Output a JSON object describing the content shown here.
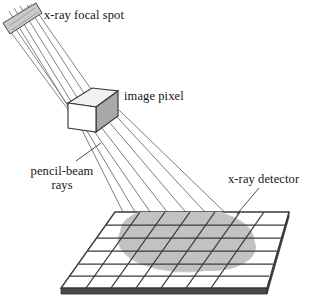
{
  "figure": {
    "background_color": "#ffffff",
    "width": 325,
    "height": 304,
    "labels": {
      "focal_spot": "x-ray focal spot",
      "image_pixel": "image pixel",
      "pencil_beam_line1": "pencil-beam",
      "pencil_beam_line2": "rays",
      "detector": "x-ray detector"
    },
    "colors": {
      "line": "#3a3a3a",
      "ray": "#6e6e6e",
      "cube_face_front": "#ffffff",
      "cube_face_top": "#f2f2f2",
      "cube_face_right": "#a8a8a8",
      "focal_spot_fill": "#c9c9c9",
      "blob_fill": "#c2c2c2",
      "detector_edge_dark": "#4a4a4a",
      "text": "#141414"
    },
    "components": {
      "focal_spot": {
        "name": "x-ray focal spot",
        "shape": "tilted-rectangle",
        "center_x": 21,
        "center_y": 18
      },
      "image_pixel": {
        "name": "image pixel",
        "shape": "cube",
        "center_x": 92,
        "center_y": 110
      },
      "detector": {
        "name": "x-ray detector",
        "shape": "grid-slab",
        "rows": 6,
        "columns": 7
      },
      "beam_spot": {
        "name": "beam footprint",
        "shape": "ellipse",
        "center_x": 186,
        "center_y": 240
      },
      "upper_rays_count": 5,
      "lower_rays_count": 6
    }
  }
}
